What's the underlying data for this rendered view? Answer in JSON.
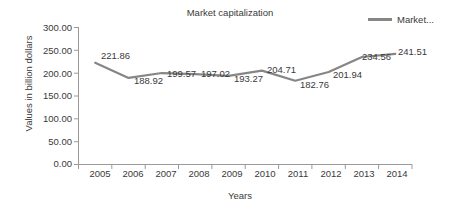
{
  "chart_data": {
    "type": "line",
    "title": "Market capitalization",
    "xlabel": "Years",
    "ylabel": "Values in billion dollars",
    "categories": [
      "2005",
      "2006",
      "2007",
      "2008",
      "2009",
      "2010",
      "2011",
      "2012",
      "2013",
      "2014"
    ],
    "series": [
      {
        "name": "Market...",
        "color": "#868686",
        "values": [
          221.86,
          188.92,
          199.57,
          197.02,
          193.27,
          204.71,
          182.76,
          201.94,
          234.56,
          241.51
        ]
      }
    ],
    "value_labels": [
      "221.86",
      "188.92",
      "199.57",
      "197.02",
      "193.27",
      "204.71",
      "182.76",
      "201.94",
      "234.56",
      "241.51"
    ],
    "ylim": [
      0,
      300
    ],
    "ytick_labels": [
      "300.00",
      "250.00",
      "200.00",
      "150.00",
      "100.00",
      "50.00",
      "0.00"
    ],
    "ytick_values": [
      300,
      250,
      200,
      150,
      100,
      50,
      0
    ],
    "grid": false,
    "legend_position": "top-right",
    "legend_entries": [
      "Market..."
    ]
  },
  "axis_colors": {
    "axis_line": "#9a9a9a",
    "text": "#3a3a3a",
    "background": "#ffffff"
  }
}
